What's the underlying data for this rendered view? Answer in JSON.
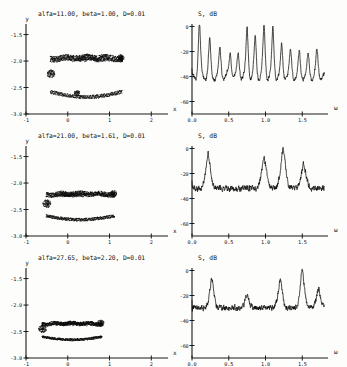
{
  "figure": {
    "background": "#fdfdfb",
    "ink": "#0d0d0d",
    "rows": 3
  },
  "chart_data": [
    {
      "type": "scatter",
      "panel": "phase-portrait",
      "row": 1,
      "title": "alfa=11.00, beta=1.00, D=0.01",
      "xlabel": "x",
      "ylabel": "y",
      "xlim": [
        -1,
        2.4
      ],
      "ylim": [
        -3.0,
        -1.3
      ],
      "xticks": [
        -1,
        0,
        1,
        2
      ],
      "xticklabels": [
        "-1",
        "0",
        "1",
        "2"
      ],
      "yticks": [
        -1.5,
        -2.0,
        -2.5,
        -3.0
      ],
      "yticklabels": [
        "-1.5",
        "-2.0",
        "-2.5",
        "-3.0"
      ],
      "grid": false,
      "description": "chaotic attractor, open loop with dense upper filament and lower return branch",
      "params": {
        "alfa": 11.0,
        "beta": 1.0,
        "D": 0.01
      }
    },
    {
      "type": "line",
      "panel": "power-spectrum",
      "row": 1,
      "title": "S, dB",
      "xlabel": "ω",
      "ylabel": "S, dB",
      "xlim": [
        0.0,
        1.85
      ],
      "ylim": [
        -70,
        2
      ],
      "xticks": [
        0.0,
        0.5,
        1.0,
        1.5
      ],
      "xticklabels": [
        "0.0",
        "0.5",
        "1.0",
        "1.5"
      ],
      "yticks": [
        0,
        -20,
        -40,
        -60
      ],
      "yticklabels": [
        "0",
        "-20",
        "-40",
        "-60"
      ],
      "grid": false,
      "description": "quasi-periodic spectrum, ~12 sharp equally spaced peaks on -40 dB floor",
      "peaks_omega": [
        0.1,
        0.24,
        0.38,
        0.52,
        0.63,
        0.75,
        0.86,
        0.98,
        1.1,
        1.22,
        1.34,
        1.46,
        1.58,
        1.7
      ],
      "peaks_db": [
        -7,
        -19,
        -23,
        -25,
        -27,
        -10,
        -16,
        -9,
        -12,
        -22,
        -24,
        -26,
        -28,
        -24
      ],
      "noise_floor_db": -40
    },
    {
      "type": "scatter",
      "panel": "phase-portrait",
      "row": 2,
      "title": "alfa=21.00, beta=1.61, D=0.01",
      "xlabel": "x",
      "ylabel": "y",
      "xlim": [
        -1,
        2.4
      ],
      "ylim": [
        -3.0,
        -1.3
      ],
      "xticks": [
        -1,
        0,
        1,
        2
      ],
      "xticklabels": [
        "-1",
        "0",
        "1",
        "2"
      ],
      "yticks": [
        -1.5,
        -2.0,
        -2.5,
        -3.0
      ],
      "yticklabels": [
        "-1.5",
        "-2.0",
        "-2.5",
        "-3.0"
      ],
      "grid": false,
      "description": "flattened elongated attractor band between y=-2.2 and y=-2.6",
      "params": {
        "alfa": 21.0,
        "beta": 1.61,
        "D": 0.01
      }
    },
    {
      "type": "line",
      "panel": "power-spectrum",
      "row": 2,
      "title": "S, dB",
      "xlabel": "ω",
      "ylabel": "S, dB",
      "xlim": [
        0.0,
        1.85
      ],
      "ylim": [
        -70,
        2
      ],
      "xticks": [
        0.0,
        0.5,
        1.0,
        1.5
      ],
      "xticklabels": [
        "0.0",
        "0.5",
        "1.0",
        "1.5"
      ],
      "yticks": [
        0,
        -20,
        -40,
        -60
      ],
      "yticklabels": [
        "0",
        "-20",
        "-40",
        "-60"
      ],
      "grid": false,
      "description": "broadband noisy spectrum with 4 dominant broad peaks",
      "peaks_omega": [
        0.22,
        0.98,
        1.24,
        1.52
      ],
      "peaks_db": [
        -11,
        -13,
        -8,
        -17
      ],
      "noise_floor_db": -32
    },
    {
      "type": "scatter",
      "panel": "phase-portrait",
      "row": 3,
      "title": "alfa=27.65, beta=2.20, D=0.01",
      "xlabel": "x",
      "ylabel": "y",
      "xlim": [
        -1,
        2.4
      ],
      "ylim": [
        -3.0,
        -1.3
      ],
      "xticks": [
        -1,
        0,
        1,
        2
      ],
      "xticklabels": [
        "-1",
        "0",
        "1",
        "2"
      ],
      "yticks": [
        -1.5,
        -2.0,
        -2.5,
        -3.0
      ],
      "yticklabels": [
        "-1.5",
        "-2.0",
        "-2.5",
        "-3.0"
      ],
      "grid": false,
      "description": "compact thin attractor band near y=-2.45, narrower x extent",
      "params": {
        "alfa": 27.65,
        "beta": 2.2,
        "D": 0.01
      }
    },
    {
      "type": "line",
      "panel": "power-spectrum",
      "row": 3,
      "title": "S, dB",
      "xlabel": "ω",
      "ylabel": "S, dB",
      "xlim": [
        0.0,
        1.85
      ],
      "ylim": [
        -70,
        2
      ],
      "xticks": [
        0.0,
        0.5,
        1.0,
        1.5
      ],
      "xticklabels": [
        "0.0",
        "0.5",
        "1.0",
        "1.5"
      ],
      "yticks": [
        0,
        -20,
        -40,
        -60
      ],
      "yticklabels": [
        "0",
        "-20",
        "-40",
        "-60"
      ],
      "grid": false,
      "description": "noisy broadband spectrum, peaks near 0.27, 1.2 and sharp spike at 1.5",
      "peaks_omega": [
        0.27,
        0.75,
        1.2,
        1.5,
        1.72
      ],
      "peaks_db": [
        -12,
        -22,
        -13,
        -6,
        -18
      ],
      "noise_floor_db": -30
    }
  ],
  "rows": [
    {
      "title": "alfa=11.00, beta=1.00, D=0.01",
      "spectrum_label": "S, dB",
      "phase": {
        "ylabel": "y",
        "xlabel": "x",
        "yticklabels": [
          "-1.5",
          "-2.0",
          "-2.5",
          "-3.0"
        ],
        "xticklabels": [
          "-1",
          "0",
          "1",
          "2"
        ]
      },
      "spectrum": {
        "xlabel": "ω",
        "yticklabels": [
          "0",
          "-20",
          "-40",
          "-60"
        ],
        "xticklabels": [
          "0.0",
          "0.5",
          "1.0",
          "1.5"
        ]
      }
    },
    {
      "title": "alfa=21.00, beta=1.61, D=0.01",
      "spectrum_label": "S, dB",
      "phase": {
        "ylabel": "y",
        "xlabel": "x",
        "yticklabels": [
          "-1.5",
          "-2.0",
          "-2.5",
          "-3.0"
        ],
        "xticklabels": [
          "-1",
          "0",
          "1",
          "2"
        ]
      },
      "spectrum": {
        "xlabel": "ω",
        "yticklabels": [
          "0",
          "-20",
          "-40",
          "-60"
        ],
        "xticklabels": [
          "0.0",
          "0.5",
          "1.0",
          "1.5"
        ]
      }
    },
    {
      "title": "alfa=27.65, beta=2.20, D=0.01",
      "spectrum_label": "S, dB",
      "phase": {
        "ylabel": "y",
        "xlabel": "x",
        "yticklabels": [
          "-1.5",
          "-2.0",
          "-2.5",
          "-3.0"
        ],
        "xticklabels": [
          "-1",
          "0",
          "1",
          "2"
        ]
      },
      "spectrum": {
        "xlabel": "ω",
        "yticklabels": [
          "0",
          "-20",
          "-40",
          "-60"
        ],
        "xticklabels": [
          "0.0",
          "0.5",
          "1.0",
          "1.5"
        ]
      }
    }
  ]
}
